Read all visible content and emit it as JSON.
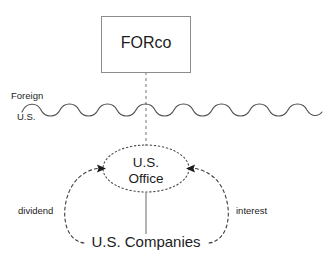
{
  "diagram": {
    "title_text": "FORco",
    "nodes": {
      "forco": {
        "label": "FORco",
        "shape": "rectangle",
        "stroke": "#8c8c8c"
      },
      "us_office": {
        "label_line1": "U.S.",
        "label_line2": "Office",
        "shape": "ellipse",
        "stroke": "#4d4d4d"
      },
      "us_companies": {
        "label": "U.S. Companies",
        "shape": "text",
        "stroke": "#4d4d4d"
      }
    },
    "boundary": {
      "above_label": "Foreign",
      "below_label": "U.S.",
      "style": "wavy-line",
      "stroke": "#4d4d4d"
    },
    "edges": [
      {
        "name": "forco-to-office",
        "style": "dashed-vertical",
        "label": "",
        "arrow": false
      },
      {
        "name": "companies-to-office-left",
        "style": "dashed-arc",
        "label": "dividend",
        "arrow": true
      },
      {
        "name": "companies-to-office-right",
        "style": "dashed-arc",
        "label": "interest",
        "arrow": true
      },
      {
        "name": "office-to-companies-center",
        "style": "solid-vertical",
        "label": "",
        "arrow": false
      }
    ],
    "colors": {
      "background": "#ffffff",
      "text": "#1c1c1c",
      "line_dark": "#4d4d4d",
      "line_light": "#8c8c8c"
    }
  }
}
